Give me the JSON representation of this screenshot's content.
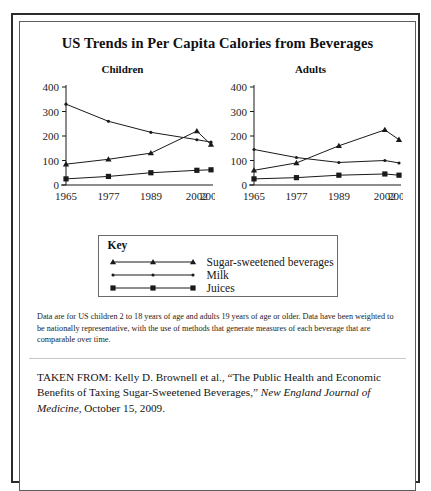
{
  "figure": {
    "title": "US Trends in Per Capita Calories from Beverages",
    "note": "Data are for US children 2 to 18 years of age and adults 19 years of age or older. Data have been weighted to be nationally representative, with the use of methods that generate measures of each beverage that are comparable over time.",
    "source": {
      "lead": "TAKEN FROM: Kelly D. Brownell et al., “The Public Health and Economic Benefits of Taxing Sugar-Sweetened Beverages,” ",
      "journal": "New England Journal of Medicine",
      "tail": ", October 15, 2009."
    },
    "key": {
      "heading": "Key",
      "entries": [
        {
          "label": "Sugar-sweetened beverages",
          "marker": "triangle"
        },
        {
          "label": "Milk",
          "marker": "dot"
        },
        {
          "label": "Juices",
          "marker": "square"
        }
      ]
    }
  },
  "chart_data": [
    {
      "type": "line",
      "title": "Children",
      "xlabel": "",
      "ylabel": "",
      "x": [
        1965,
        1977,
        1989,
        2002,
        2006
      ],
      "categories": [
        "1965",
        "1977",
        "1989",
        "2002",
        "2006"
      ],
      "yticks": [
        0,
        100,
        200,
        300,
        400
      ],
      "ylim": [
        0,
        400
      ],
      "grid": false,
      "legend_position": "below-center",
      "series": [
        {
          "name": "Milk",
          "marker": "dot",
          "values": [
            330,
            260,
            215,
            185,
            175
          ]
        },
        {
          "name": "Sugar-sweetened beverages",
          "marker": "triangle",
          "values": [
            85,
            105,
            130,
            220,
            165
          ]
        },
        {
          "name": "Juices",
          "marker": "square",
          "values": [
            25,
            35,
            50,
            60,
            62
          ]
        }
      ]
    },
    {
      "type": "line",
      "title": "Adults",
      "xlabel": "",
      "ylabel": "",
      "x": [
        1965,
        1977,
        1989,
        2002,
        2006
      ],
      "categories": [
        "1965",
        "1977",
        "1989",
        "2002",
        "2006"
      ],
      "yticks": [
        0,
        100,
        200,
        300,
        400
      ],
      "ylim": [
        0,
        400
      ],
      "grid": false,
      "legend_position": "below-center",
      "series": [
        {
          "name": "Milk",
          "marker": "dot",
          "values": [
            145,
            112,
            92,
            100,
            90
          ]
        },
        {
          "name": "Sugar-sweetened beverages",
          "marker": "triangle",
          "values": [
            60,
            90,
            160,
            225,
            185
          ]
        },
        {
          "name": "Juices",
          "marker": "square",
          "values": [
            25,
            30,
            40,
            45,
            40
          ]
        }
      ]
    }
  ]
}
